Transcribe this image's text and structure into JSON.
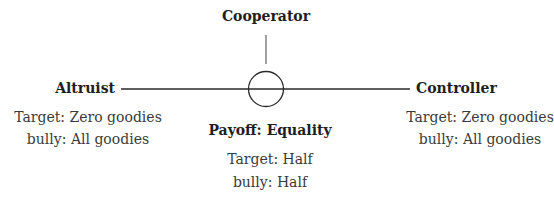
{
  "top": {
    "label": "Cooperator"
  },
  "left": {
    "label": "Altruist",
    "lines": [
      "Target: Zero goodies",
      "bully: All goodies"
    ]
  },
  "right": {
    "label": "Controller",
    "lines": [
      "Target: Zero goodies",
      "bully: All goodies"
    ]
  },
  "center": {
    "label": "Payoff: Equality",
    "lines": [
      "Target: Half",
      "bully: Half"
    ]
  }
}
